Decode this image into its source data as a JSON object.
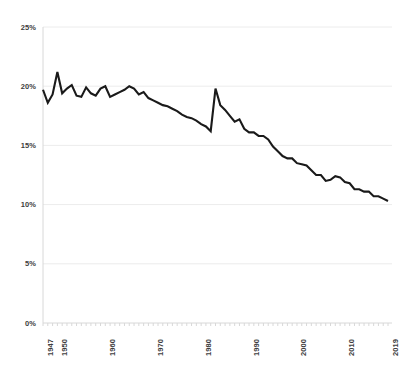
{
  "chart_data": {
    "type": "line",
    "title": "",
    "subtitle": "",
    "xlabel": "",
    "ylabel": "",
    "xlim": [
      1947,
      2019
    ],
    "ylim": [
      0,
      25
    ],
    "grid": true,
    "legend": null,
    "y_ticks": [
      {
        "value": 0,
        "label": "0%"
      },
      {
        "value": 5,
        "label": "5%"
      },
      {
        "value": 10,
        "label": "10%"
      },
      {
        "value": 15,
        "label": "15%"
      },
      {
        "value": 20,
        "label": "20%"
      },
      {
        "value": 25,
        "label": "25%"
      }
    ],
    "x_ticks": [
      {
        "value": 1947,
        "label": "1947"
      },
      {
        "value": 1950,
        "label": "1950"
      },
      {
        "value": 1960,
        "label": "1960"
      },
      {
        "value": 1970,
        "label": "1970"
      },
      {
        "value": 1980,
        "label": "1980"
      },
      {
        "value": 1990,
        "label": "1990"
      },
      {
        "value": 2000,
        "label": "2000"
      },
      {
        "value": 2010,
        "label": "2010"
      },
      {
        "value": 2019,
        "label": "2019"
      }
    ],
    "x_minor_tick_step": 1,
    "series": [
      {
        "name": "",
        "color": "#1a1a1a",
        "line_width": 2.1,
        "x": [
          1947,
          1948,
          1949,
          1950,
          1951,
          1952,
          1953,
          1954,
          1955,
          1956,
          1957,
          1958,
          1959,
          1960,
          1961,
          1962,
          1963,
          1964,
          1965,
          1966,
          1967,
          1968,
          1969,
          1970,
          1971,
          1972,
          1973,
          1974,
          1975,
          1976,
          1977,
          1978,
          1979,
          1980,
          1981,
          1982,
          1983,
          1984,
          1985,
          1986,
          1987,
          1988,
          1989,
          1990,
          1991,
          1992,
          1993,
          1994,
          1995,
          1996,
          1997,
          1998,
          1999,
          2000,
          2001,
          2002,
          2003,
          2004,
          2005,
          2006,
          2007,
          2008,
          2009,
          2010,
          2011,
          2012,
          2013,
          2014,
          2015,
          2016,
          2017,
          2018,
          2019
        ],
        "y": [
          19.7,
          18.6,
          19.3,
          21.2,
          19.4,
          19.8,
          20.1,
          19.2,
          19.1,
          19.9,
          19.4,
          19.2,
          19.8,
          20.0,
          19.1,
          19.3,
          19.5,
          19.7,
          20.0,
          19.8,
          19.3,
          19.5,
          19.0,
          18.8,
          18.6,
          18.4,
          18.3,
          18.1,
          17.9,
          17.6,
          17.4,
          17.3,
          17.1,
          16.8,
          16.6,
          16.2,
          19.8,
          18.4,
          18.0,
          17.5,
          17.0,
          17.2,
          16.4,
          16.1,
          16.1,
          15.8,
          15.8,
          15.5,
          14.9,
          14.5,
          14.1,
          13.9,
          13.9,
          13.5,
          13.4,
          13.3,
          12.9,
          12.5,
          12.5,
          12.0,
          12.1,
          12.4,
          12.3,
          11.9,
          11.8,
          11.3,
          11.3,
          11.1,
          11.1,
          10.7,
          10.7,
          10.5,
          10.3
        ]
      }
    ],
    "colors": {
      "line": "#1a1a1a",
      "grid": "#ececec",
      "axis": "#d8d8d8",
      "tick_label": "#3d3d3d",
      "background": "#ffffff"
    }
  }
}
